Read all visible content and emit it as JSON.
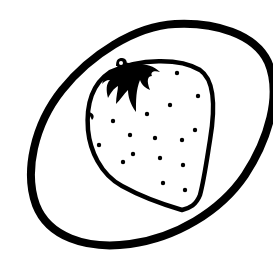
{
  "illustration": {
    "label": "Strawberry on a plate",
    "style": "black line art on white",
    "colors": {
      "background": "#ffffff",
      "ink": "#000000"
    },
    "plate": {
      "shape": "tilted ellipse, cropped at right edge"
    },
    "strawberry": {
      "leaves": "solid black calyx with stem",
      "seed_count": 16,
      "seeds": [
        [
          177,
          73
        ],
        [
          198,
          96
        ],
        [
          170,
          105
        ],
        [
          147,
          114
        ],
        [
          113,
          121
        ],
        [
          195,
          130
        ],
        [
          130,
          135
        ],
        [
          155,
          138
        ],
        [
          182,
          140
        ],
        [
          99,
          145
        ],
        [
          133,
          154
        ],
        [
          123,
          162
        ],
        [
          160,
          158
        ],
        [
          183,
          165
        ],
        [
          163,
          183
        ],
        [
          185,
          190
        ]
      ]
    }
  }
}
